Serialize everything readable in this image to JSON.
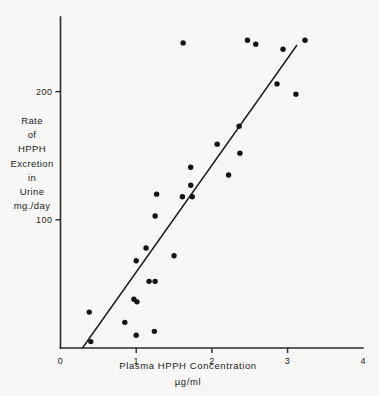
{
  "chart_data": {
    "type": "scatter",
    "title": "",
    "xlabel": "Plasma HPPH Concentration",
    "xlabel_units": "µg/ml",
    "ylabel_lines": [
      "Rate",
      "of",
      "HPPH",
      "Excretion",
      "in",
      "Urine",
      "mg./day"
    ],
    "ylabel": "Rate of HPPH Excretion in Urine mg./day",
    "xlim": [
      0,
      4
    ],
    "ylim": [
      0,
      270
    ],
    "xticks": [
      0,
      1,
      2,
      3,
      4
    ],
    "xtick_labels": [
      "0",
      "1",
      "2",
      "3",
      "4"
    ],
    "yticks": [
      100,
      200
    ],
    "ytick_labels": [
      "100",
      "200"
    ],
    "grid": false,
    "legend": false,
    "point_color": "#141414",
    "line_color": "#1f1f1f",
    "axis_color": "#2a2a2a",
    "background_color": "#f7f7f5",
    "fit_line": {
      "label": "regression line",
      "x_start": 0.29,
      "y_start": 0,
      "x_end": 3.12,
      "y_end": 236
    },
    "points": [
      {
        "x": 0.38,
        "y": 28
      },
      {
        "x": 0.4,
        "y": 5
      },
      {
        "x": 0.85,
        "y": 20
      },
      {
        "x": 0.97,
        "y": 38
      },
      {
        "x": 1.0,
        "y": 10
      },
      {
        "x": 1.0,
        "y": 68
      },
      {
        "x": 1.01,
        "y": 36
      },
      {
        "x": 1.13,
        "y": 78
      },
      {
        "x": 1.17,
        "y": 52
      },
      {
        "x": 1.24,
        "y": 13
      },
      {
        "x": 1.25,
        "y": 52
      },
      {
        "x": 1.25,
        "y": 103
      },
      {
        "x": 1.27,
        "y": 120
      },
      {
        "x": 1.5,
        "y": 72
      },
      {
        "x": 1.62,
        "y": 238
      },
      {
        "x": 1.61,
        "y": 118
      },
      {
        "x": 1.72,
        "y": 127
      },
      {
        "x": 1.74,
        "y": 118
      },
      {
        "x": 1.72,
        "y": 141
      },
      {
        "x": 2.07,
        "y": 159
      },
      {
        "x": 2.22,
        "y": 135
      },
      {
        "x": 2.36,
        "y": 173
      },
      {
        "x": 2.37,
        "y": 152
      },
      {
        "x": 2.47,
        "y": 240
      },
      {
        "x": 2.58,
        "y": 237
      },
      {
        "x": 2.86,
        "y": 206
      },
      {
        "x": 2.94,
        "y": 233
      },
      {
        "x": 3.11,
        "y": 198
      },
      {
        "x": 3.23,
        "y": 240
      }
    ]
  },
  "geometry": {
    "x_origin_px": 60.5,
    "y_origin_px": 348,
    "px_per_x_unit": 75.7,
    "px_per_y_unit": 1.282,
    "y_axis_top_px": 17,
    "x_axis_right_px": 363
  }
}
